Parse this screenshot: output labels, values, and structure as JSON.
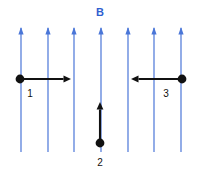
{
  "figure": {
    "title_label": "B",
    "background_color": "#ffffff",
    "width": 199,
    "height": 172
  },
  "field": {
    "label": "B",
    "label_color": "#2f5fd0",
    "label_x": 100,
    "label_y": 16,
    "line_color": "#4a76d8",
    "direction": "up",
    "line_top_y": 27,
    "line_bottom_y": 152,
    "line_x_positions": [
      21,
      48,
      74,
      101,
      128,
      154,
      181
    ],
    "count": 7
  },
  "particles": [
    {
      "label": "1",
      "dot_x": 20,
      "dot_y": 79,
      "dot_color": "#111111",
      "vector_color": "#111111",
      "vector_direction": "right",
      "vector_tip_x": 71,
      "vector_tip_y": 79,
      "label_x": 30,
      "label_y": 97
    },
    {
      "label": "2",
      "dot_x": 100,
      "dot_y": 143,
      "dot_color": "#111111",
      "vector_color": "#111111",
      "vector_direction": "up",
      "vector_tip_x": 100,
      "vector_tip_y": 102,
      "label_x": 100,
      "label_y": 166
    },
    {
      "label": "3",
      "dot_x": 182,
      "dot_y": 79,
      "dot_color": "#111111",
      "vector_color": "#111111",
      "vector_direction": "left",
      "vector_tip_x": 131,
      "vector_tip_y": 79,
      "label_x": 166,
      "label_y": 97
    }
  ]
}
